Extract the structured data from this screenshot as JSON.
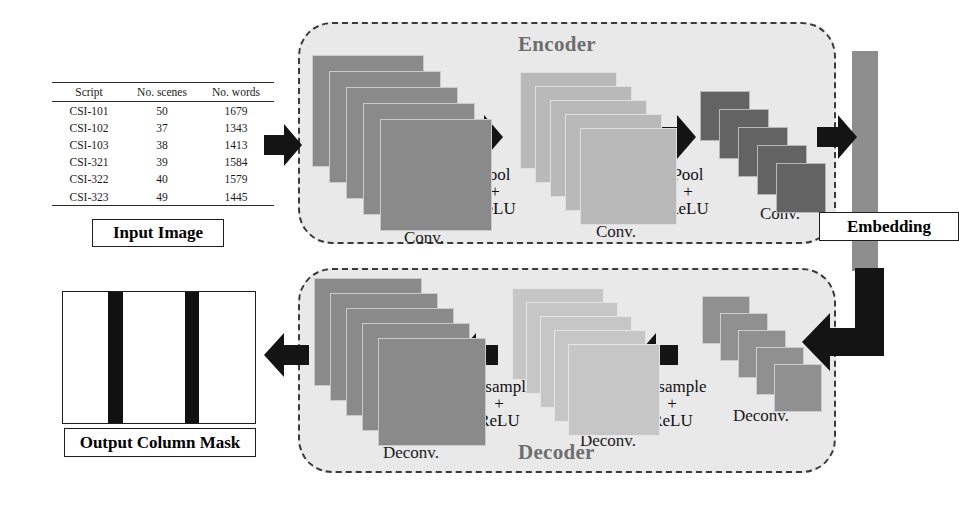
{
  "figure": {
    "type": "diagram"
  },
  "input": {
    "label": "Input Image",
    "table": {
      "headers": [
        "Script",
        "No. scenes",
        "No. words"
      ],
      "rows": [
        [
          "CSI-101",
          "50",
          "1679"
        ],
        [
          "CSI-102",
          "37",
          "1343"
        ],
        [
          "CSI-103",
          "38",
          "1413"
        ],
        [
          "CSI-321",
          "39",
          "1584"
        ],
        [
          "CSI-322",
          "40",
          "1579"
        ],
        [
          "CSI-323",
          "49",
          "1445"
        ]
      ]
    }
  },
  "encoder": {
    "title": "Encoder",
    "blocks": [
      {
        "caption": "Conv.",
        "color": "#8a8a8a",
        "cards": 5
      },
      {
        "caption": "Conv.",
        "color": "#b9b9b9",
        "cards": 5
      },
      {
        "caption": "Conv.",
        "color": "#636363",
        "cards": 5
      }
    ],
    "ops": [
      {
        "line1": "Pool",
        "line2": "+",
        "line3": "ReLU"
      },
      {
        "line1": "Pool",
        "line2": "+",
        "line3": "ReLU"
      }
    ]
  },
  "embedding": {
    "label": "Embedding",
    "color": "#8e8e8e"
  },
  "decoder": {
    "title": "Decoder",
    "blocks": [
      {
        "caption": "Deconv.",
        "color": "#8a8a8a",
        "cards": 5
      },
      {
        "caption": "Deconv.",
        "color": "#c6c6c6",
        "cards": 5
      },
      {
        "caption": "Deconv.",
        "color": "#909090",
        "cards": 5
      }
    ],
    "ops": [
      {
        "line1": "Upsample",
        "line2": "+",
        "line3": "ReLU"
      },
      {
        "line1": "Upsample",
        "line2": "+",
        "line3": "ReLU"
      }
    ]
  },
  "output": {
    "label": "Output Column Mask",
    "mask_bar_color": "#111111",
    "bars": [
      {
        "left": 45,
        "width": 15
      },
      {
        "left": 122,
        "width": 14
      }
    ]
  },
  "arrows": {
    "input_to_encoder": "arrow-right",
    "encoder_pool_1": "arrow-right",
    "encoder_pool_2": "arrow-right",
    "encoder_to_embedding": "arrow-right",
    "embedding_to_decoder": "elbow-arrow-down-left",
    "decoder_upsample_1": "arrow-left",
    "decoder_upsample_2": "arrow-left",
    "decoder_to_output": "arrow-left"
  },
  "colors": {
    "stage_fill": "#e9e9e9",
    "stage_border": "#3a3a3a",
    "stage_title": "#6e6e6e",
    "arrow": "#141414",
    "text": "#111111"
  }
}
